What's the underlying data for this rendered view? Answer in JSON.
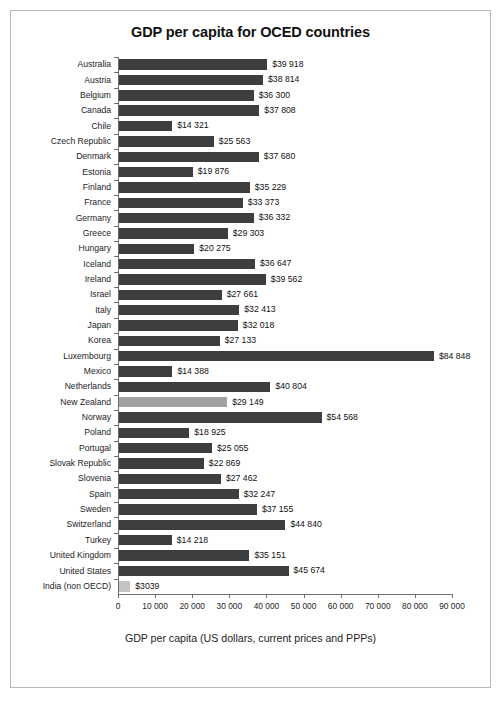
{
  "chart_data": {
    "type": "bar",
    "orientation": "horizontal",
    "title": "GDP per capita for OCED countries",
    "xlabel": "GDP per capita (US dollars, current prices and PPPs)",
    "ylabel": "",
    "xlim": [
      0,
      90000
    ],
    "grid": false,
    "legend": "none",
    "xticks": [
      0,
      10000,
      20000,
      30000,
      40000,
      50000,
      60000,
      70000,
      80000,
      90000
    ],
    "xtick_labels": [
      "0",
      "10 000",
      "20 000",
      "30 000",
      "40 000",
      "50 000",
      "60 000",
      "70 000",
      "80 000",
      "90 000"
    ],
    "categories": [
      "Australia",
      "Austria",
      "Belgium",
      "Canada",
      "Chile",
      "Czech Republic",
      "Denmark",
      "Estonia",
      "Finland",
      "France",
      "Germany",
      "Greece",
      "Hungary",
      "Iceland",
      "Ireland",
      "Israel",
      "Italy",
      "Japan",
      "Korea",
      "Luxembourg",
      "Mexico",
      "Netherlands",
      "New Zealand",
      "Norway",
      "Poland",
      "Portugal",
      "Slovak Republic",
      "Slovenia",
      "Spain",
      "Sweden",
      "Switzerland",
      "Turkey",
      "United Kingdom",
      "United States",
      "India (non OECD)"
    ],
    "values": [
      39918,
      38814,
      36300,
      37808,
      14321,
      25563,
      37680,
      19876,
      35229,
      33373,
      36332,
      29303,
      20275,
      36647,
      39562,
      27661,
      32413,
      32018,
      27133,
      84848,
      14388,
      40804,
      29149,
      54568,
      18925,
      25055,
      22869,
      27462,
      32247,
      37155,
      44840,
      14218,
      35151,
      45674,
      3039
    ],
    "value_labels": [
      "$39 918",
      "$38 814",
      "$36 300",
      "$37 808",
      "$14 321",
      "$25 563",
      "$37 680",
      "$19 876",
      "$35 229",
      "$33 373",
      "$36 332",
      "$29 303",
      "$20 275",
      "$36 647",
      "$39 562",
      "$27 661",
      "$32 413",
      "$32 018",
      "$27 133",
      "$84 848",
      "$14 388",
      "$40 804",
      "$29 149",
      "$54 568",
      "$18 925",
      "$25 055",
      "$22 869",
      "$27 462",
      "$32 247",
      "$37 155",
      "$44 840",
      "$14 218",
      "$35 151",
      "$45 674",
      "$3039"
    ],
    "bar_colors": [
      "#3e3e3e",
      "#3e3e3e",
      "#3e3e3e",
      "#3e3e3e",
      "#3e3e3e",
      "#3e3e3e",
      "#3e3e3e",
      "#3e3e3e",
      "#3e3e3e",
      "#3e3e3e",
      "#3e3e3e",
      "#3e3e3e",
      "#3e3e3e",
      "#3e3e3e",
      "#3e3e3e",
      "#3e3e3e",
      "#3e3e3e",
      "#3e3e3e",
      "#3e3e3e",
      "#3e3e3e",
      "#3e3e3e",
      "#3e3e3e",
      "#a3a3a3",
      "#3e3e3e",
      "#3e3e3e",
      "#3e3e3e",
      "#3e3e3e",
      "#3e3e3e",
      "#3e3e3e",
      "#3e3e3e",
      "#3e3e3e",
      "#3e3e3e",
      "#3e3e3e",
      "#3e3e3e",
      "#c4c4c4"
    ],
    "colors": {
      "bar_default": "#3e3e3e",
      "bar_highlight": "#a3a3a3",
      "bar_nonoecd": "#c4c4c4",
      "axis": "#6f6f6f",
      "frame_border": "#b8b8b8",
      "text": "#1d1d1d",
      "background": "#ffffff"
    }
  }
}
